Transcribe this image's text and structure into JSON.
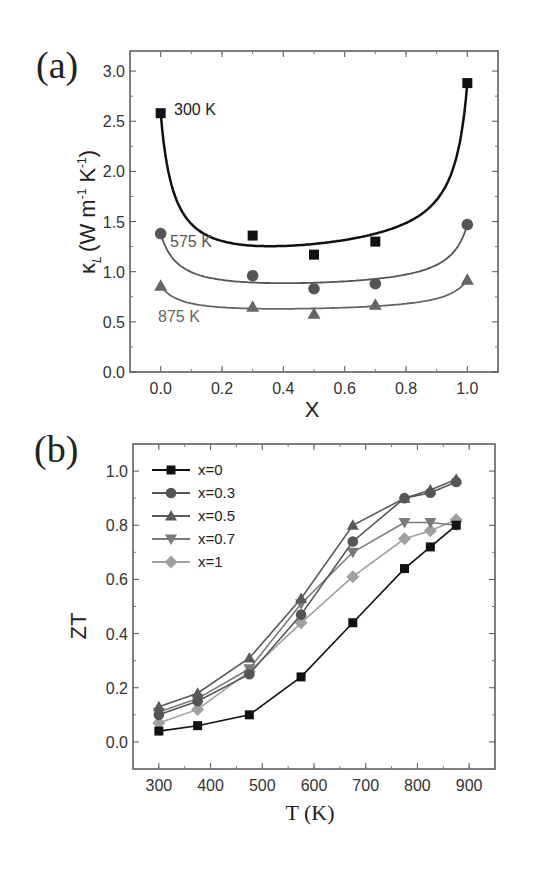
{
  "chart_data": [
    {
      "panel": "(a)",
      "type": "scatter",
      "xlabel": "X",
      "ylabel": "κL (W m-1 K-1)",
      "xlim": [
        -0.1,
        1.1
      ],
      "ylim": [
        0.0,
        3.2
      ],
      "xticks": [
        "0.0",
        "0.2",
        "0.4",
        "0.6",
        "0.8",
        "1.0"
      ],
      "yticks": [
        "0.0",
        "0.5",
        "1.0",
        "1.5",
        "2.0",
        "2.5",
        "3.0"
      ],
      "grid": false,
      "fit_curves": true,
      "x": [
        0.0,
        0.3,
        0.5,
        0.7,
        1.0
      ],
      "series": [
        {
          "name": "300 K",
          "marker": "square",
          "color": "#111111",
          "values": [
            2.58,
            1.36,
            1.17,
            1.3,
            2.88
          ]
        },
        {
          "name": "575 K",
          "marker": "circle",
          "color": "#555555",
          "values": [
            1.38,
            0.96,
            0.83,
            0.88,
            1.47
          ]
        },
        {
          "name": "875 K",
          "marker": "triangle-up",
          "color": "#666666",
          "values": [
            0.86,
            0.65,
            0.58,
            0.67,
            0.92
          ]
        }
      ],
      "annotations": [
        "300 K",
        "575 K",
        "875 K"
      ]
    },
    {
      "panel": "(b)",
      "type": "line",
      "xlabel": "T (K)",
      "ylabel": "ZT",
      "xlim": [
        250,
        950
      ],
      "ylim": [
        -0.1,
        1.1
      ],
      "xticks": [
        "300",
        "400",
        "500",
        "600",
        "700",
        "800",
        "900"
      ],
      "yticks": [
        "0.0",
        "0.2",
        "0.4",
        "0.6",
        "0.8",
        "1.0"
      ],
      "grid": false,
      "legend_position": "upper left",
      "series": [
        {
          "name": "x=0",
          "marker": "square",
          "color": "#111111",
          "x": [
            300,
            375,
            475,
            575,
            675,
            775,
            825,
            875
          ],
          "values": [
            0.04,
            0.06,
            0.1,
            0.24,
            0.44,
            0.64,
            0.72,
            0.8
          ]
        },
        {
          "name": "x=0.3",
          "marker": "circle",
          "color": "#555555",
          "x": [
            300,
            375,
            475,
            575,
            675,
            775,
            825,
            875
          ],
          "values": [
            0.1,
            0.15,
            0.25,
            0.47,
            0.74,
            0.9,
            0.92,
            0.96
          ]
        },
        {
          "name": "x=0.5",
          "marker": "triangle-up",
          "color": "#5a5a5a",
          "x": [
            300,
            375,
            475,
            575,
            675,
            775,
            825,
            875
          ],
          "values": [
            0.13,
            0.18,
            0.31,
            0.53,
            0.8,
            0.9,
            0.93,
            0.97
          ]
        },
        {
          "name": "x=0.7",
          "marker": "triangle-down",
          "color": "#7a7a7a",
          "x": [
            300,
            375,
            475,
            575,
            675,
            775,
            825,
            875
          ],
          "values": [
            0.11,
            0.16,
            0.27,
            0.51,
            0.7,
            0.81,
            0.81,
            0.8
          ]
        },
        {
          "name": "x=1",
          "marker": "diamond",
          "color": "#a0a0a0",
          "x": [
            300,
            375,
            475,
            575,
            675,
            775,
            825,
            875
          ],
          "values": [
            0.07,
            0.12,
            0.26,
            0.44,
            0.61,
            0.75,
            0.78,
            0.82
          ]
        }
      ]
    }
  ],
  "labels": {
    "panel_a": "(a)",
    "panel_b": "(b)",
    "a_xlabel": "X",
    "a_ylabel_kappa": "κ",
    "a_ylabel_sub": "L",
    "a_ylabel_units": "(W m",
    "a_ylabel_exp1": "-1",
    "a_ylabel_k": " K",
    "a_ylabel_exp2": "-1",
    "a_ylabel_close": ")",
    "b_xlabel": "T (K)",
    "b_ylabel": "ZT"
  }
}
